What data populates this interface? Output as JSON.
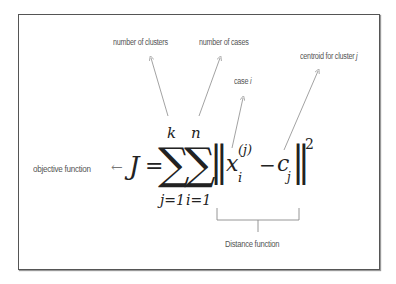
{
  "labels": {
    "clusters": "number of clusters",
    "cases": "number of cases",
    "case_i_prefix": "case",
    "case_i_var": "i",
    "centroid_prefix": "centroid for cluster",
    "centroid_var": "j",
    "objective": "objective function",
    "distance": "Distance function"
  },
  "formula": {
    "arrow": "←",
    "lhs": "J",
    "equals": "=",
    "sum_symbol": "∑",
    "sum1_upper": "k",
    "sum1_lower": "j=1",
    "sum2_upper": "n",
    "sum2_lower": "i=1",
    "norm": "‖",
    "x": "x",
    "x_sup": "(j)",
    "x_sub": "i",
    "minus": "−",
    "c": "c",
    "c_sub": "j",
    "power": "2"
  },
  "colors": {
    "frame": "#555555",
    "arrow": "#8a8a8a",
    "text": "#555555",
    "math": "#222222"
  }
}
